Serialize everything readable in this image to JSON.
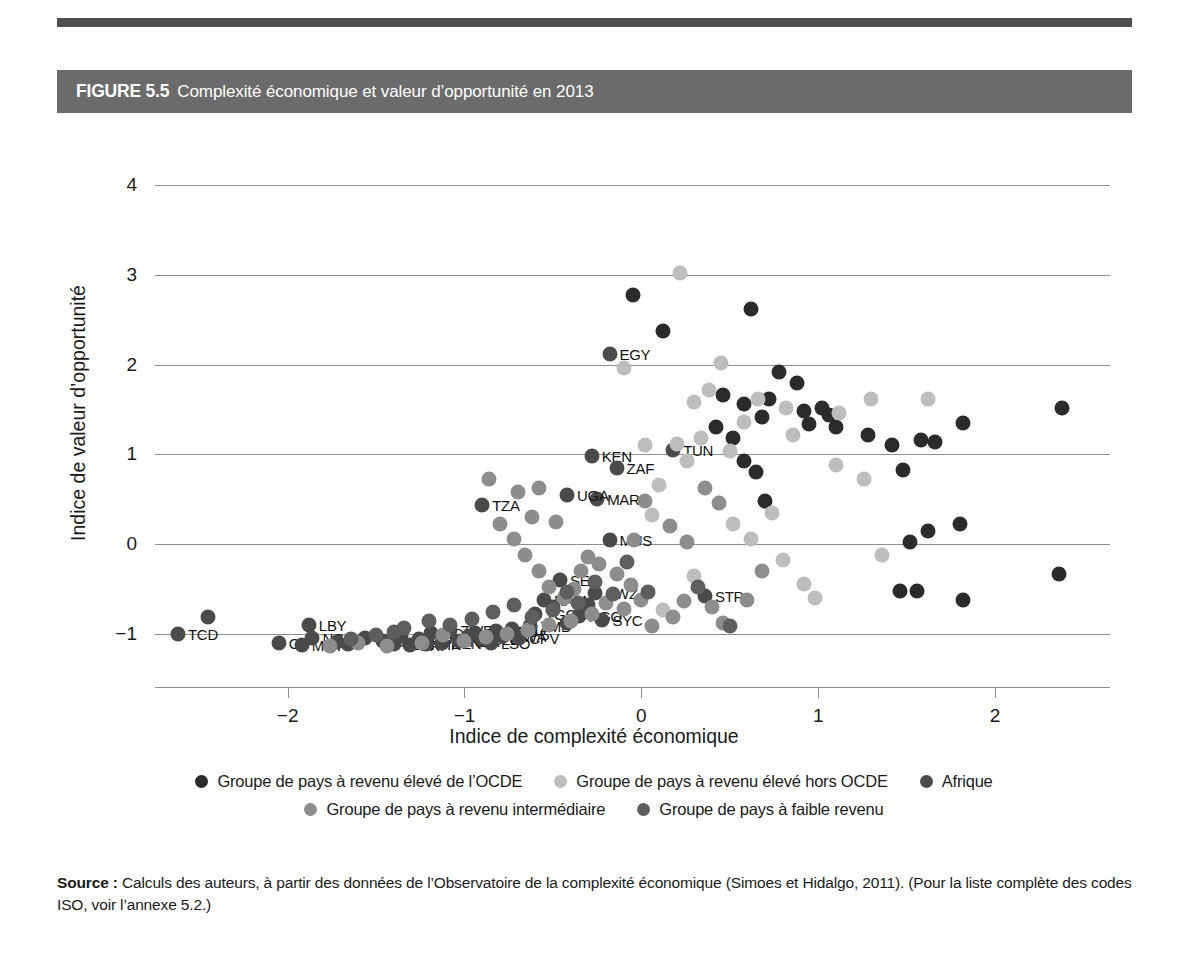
{
  "figure": {
    "number": "FIGURE 5.5",
    "title": "Complexité économique et valeur d’opportunité en 2013"
  },
  "source": {
    "label": "Source :",
    "text": " Calculs des auteurs, à partir des données de l’Observatoire de la complexité économique (Simoes et Hidalgo, 2011). (Pour la liste complète des codes ISO, voir l’annexe 5.2.)"
  },
  "legend": {
    "rows": [
      [
        {
          "label": "Groupe de pays à revenu élevé de l’OCDE",
          "color": "#2b2b2b"
        },
        {
          "label": "Groupe de pays à revenu élevé hors OCDE",
          "color": "#bdbdbd"
        },
        {
          "label": "Afrique",
          "color": "#4a4a4a"
        }
      ],
      [
        {
          "label": "Groupe de pays à revenu intermédiaire",
          "color": "#8d8d8d"
        },
        {
          "label": "Groupe de pays à faible revenu",
          "color": "#5e5e5e"
        }
      ]
    ]
  },
  "chart_data": {
    "type": "scatter",
    "title": "Complexité économique et valeur d’opportunité en 2013",
    "xlabel": "Indice de complexité économique",
    "ylabel": "Indice de valeur d’opportunité",
    "xlim": [
      -2.75,
      2.65
    ],
    "ylim": [
      -1.35,
      4.45
    ],
    "xticks": [
      -2,
      -1,
      0,
      1,
      2
    ],
    "yticks": [
      -1,
      0,
      1,
      2,
      3,
      4
    ],
    "grid": "horizontal",
    "legend_position": "below",
    "colors": {
      "ocde_high": "#2b2b2b",
      "non_ocde_high": "#bdbdbd",
      "afrique": "#4a4a4a",
      "intermediaire": "#8d8d8d",
      "faible": "#5e5e5e"
    },
    "series": [
      {
        "name": "Afrique",
        "color": "#4a4a4a",
        "points": [
          {
            "x": -2.62,
            "y": -1.0,
            "label": "TCD"
          },
          {
            "x": -2.45,
            "y": -0.81,
            "label": ""
          },
          {
            "x": -2.05,
            "y": -1.1,
            "label": "G"
          },
          {
            "x": -1.92,
            "y": -1.13,
            "label": "MRT"
          },
          {
            "x": -1.88,
            "y": -0.9,
            "label": "LBY"
          },
          {
            "x": -1.86,
            "y": -1.05,
            "label": "NGA"
          },
          {
            "x": -1.72,
            "y": -1.09,
            "label": ""
          },
          {
            "x": -1.66,
            "y": -1.12,
            "label": ""
          },
          {
            "x": -1.56,
            "y": -1.05,
            "label": ""
          },
          {
            "x": -1.46,
            "y": -1.08,
            "label": "GMB"
          },
          {
            "x": -1.4,
            "y": -1.12,
            "label": "SDN"
          },
          {
            "x": -1.36,
            "y": -1.03,
            "label": ""
          },
          {
            "x": -1.31,
            "y": -1.13,
            "label": "ERI"
          },
          {
            "x": -1.26,
            "y": -1.06,
            "label": "MOZ"
          },
          {
            "x": -1.22,
            "y": -1.12,
            "label": "GIN"
          },
          {
            "x": -1.19,
            "y": -0.99,
            "label": "MDG"
          },
          {
            "x": -1.13,
            "y": -1.1,
            "label": "BEN"
          },
          {
            "x": -1.08,
            "y": -0.96,
            "label": "ZWE"
          },
          {
            "x": -1.03,
            "y": -1.08,
            "label": "NER"
          },
          {
            "x": -0.98,
            "y": -1.04,
            "label": "CAF"
          },
          {
            "x": -0.94,
            "y": -0.99,
            "label": "BFA"
          },
          {
            "x": -0.9,
            "y": -1.06,
            "label": "SLE"
          },
          {
            "x": -0.85,
            "y": -1.11,
            "label": "LSO"
          },
          {
            "x": -0.82,
            "y": -0.97,
            "label": "GNB"
          },
          {
            "x": -0.78,
            "y": -1.03,
            "label": "BWA"
          },
          {
            "x": -0.73,
            "y": -0.95,
            "label": "MLI"
          },
          {
            "x": -0.69,
            "y": -1.05,
            "label": "CPV"
          },
          {
            "x": -0.63,
            "y": -0.92,
            "label": "ZMB"
          },
          {
            "x": -0.6,
            "y": -0.78,
            "label": "TGO"
          },
          {
            "x": -0.55,
            "y": -0.62,
            "label": "NAM"
          },
          {
            "x": -0.5,
            "y": -0.7,
            "label": ""
          },
          {
            "x": -0.46,
            "y": -0.4,
            "label": "SEN"
          },
          {
            "x": -0.42,
            "y": -0.88,
            "label": ""
          },
          {
            "x": -0.35,
            "y": -0.8,
            "label": "AGO"
          },
          {
            "x": -0.3,
            "y": -0.68,
            "label": ""
          },
          {
            "x": -0.26,
            "y": -0.55,
            "label": "SWZ"
          },
          {
            "x": -0.22,
            "y": -0.85,
            "label": "SYC"
          },
          {
            "x": -0.18,
            "y": 0.04,
            "label": "MUS"
          },
          {
            "x": -0.25,
            "y": 0.5,
            "label": "MAR"
          },
          {
            "x": -0.42,
            "y": 0.55,
            "label": "UGA"
          },
          {
            "x": -0.9,
            "y": 0.43,
            "label": "TZA"
          },
          {
            "x": -0.28,
            "y": 0.98,
            "label": "KEN"
          },
          {
            "x": -0.14,
            "y": 0.85,
            "label": "ZAF"
          },
          {
            "x": 0.18,
            "y": 1.05,
            "label": "TUN"
          },
          {
            "x": -0.18,
            "y": 2.12,
            "label": "EGY"
          },
          {
            "x": 0.36,
            "y": -0.58,
            "label": "STP"
          }
        ]
      },
      {
        "name": "Groupe de pays à revenu élevé de l’OCDE",
        "color": "#2b2b2b",
        "points": [
          {
            "x": 0.62,
            "y": 2.62
          },
          {
            "x": 0.12,
            "y": 2.38
          },
          {
            "x": -0.05,
            "y": 2.78
          },
          {
            "x": 0.78,
            "y": 1.92
          },
          {
            "x": 0.88,
            "y": 1.8
          },
          {
            "x": 0.92,
            "y": 1.48
          },
          {
            "x": 1.02,
            "y": 1.52
          },
          {
            "x": 1.06,
            "y": 1.44
          },
          {
            "x": 1.1,
            "y": 1.3
          },
          {
            "x": 0.95,
            "y": 1.34
          },
          {
            "x": 0.72,
            "y": 1.62
          },
          {
            "x": 0.58,
            "y": 1.56
          },
          {
            "x": 0.68,
            "y": 1.42
          },
          {
            "x": 1.28,
            "y": 1.22
          },
          {
            "x": 1.42,
            "y": 1.1
          },
          {
            "x": 1.58,
            "y": 1.16
          },
          {
            "x": 1.66,
            "y": 1.14
          },
          {
            "x": 1.82,
            "y": 1.35
          },
          {
            "x": 2.38,
            "y": 1.52
          },
          {
            "x": 1.48,
            "y": 0.82
          },
          {
            "x": 1.62,
            "y": 0.14
          },
          {
            "x": 1.52,
            "y": 0.02
          },
          {
            "x": 1.8,
            "y": 0.22
          },
          {
            "x": 1.46,
            "y": -0.52
          },
          {
            "x": 1.56,
            "y": -0.52
          },
          {
            "x": 1.82,
            "y": -0.62
          },
          {
            "x": 2.36,
            "y": -0.33
          },
          {
            "x": 0.58,
            "y": 0.92
          },
          {
            "x": 0.65,
            "y": 0.8
          },
          {
            "x": 0.7,
            "y": 0.48
          },
          {
            "x": 0.52,
            "y": 1.18
          },
          {
            "x": 0.46,
            "y": 1.66
          },
          {
            "x": 0.42,
            "y": 1.3
          }
        ]
      },
      {
        "name": "Groupe de pays à revenu élevé hors OCDE",
        "color": "#bdbdbd",
        "points": [
          {
            "x": 0.22,
            "y": 3.02
          },
          {
            "x": 0.45,
            "y": 2.02
          },
          {
            "x": 0.38,
            "y": 1.72
          },
          {
            "x": 0.3,
            "y": 1.58
          },
          {
            "x": 0.34,
            "y": 1.18
          },
          {
            "x": 0.58,
            "y": 1.36
          },
          {
            "x": 0.66,
            "y": 1.62
          },
          {
            "x": 0.82,
            "y": 1.52
          },
          {
            "x": 0.86,
            "y": 1.22
          },
          {
            "x": 1.12,
            "y": 1.46
          },
          {
            "x": 1.3,
            "y": 1.62
          },
          {
            "x": 1.62,
            "y": 1.62
          },
          {
            "x": 1.1,
            "y": 0.88
          },
          {
            "x": 1.26,
            "y": 0.72
          },
          {
            "x": 1.36,
            "y": -0.12
          },
          {
            "x": 0.5,
            "y": 1.04
          },
          {
            "x": 0.26,
            "y": 0.92
          },
          {
            "x": 0.2,
            "y": 1.12
          },
          {
            "x": 0.02,
            "y": 1.1
          },
          {
            "x": -0.1,
            "y": 1.96
          },
          {
            "x": 0.1,
            "y": 0.66
          },
          {
            "x": 0.06,
            "y": 0.32
          },
          {
            "x": 0.52,
            "y": 0.22
          },
          {
            "x": 0.62,
            "y": 0.06
          },
          {
            "x": 0.74,
            "y": 0.34
          },
          {
            "x": 0.8,
            "y": -0.18
          },
          {
            "x": 0.92,
            "y": -0.45
          },
          {
            "x": 0.98,
            "y": -0.6
          },
          {
            "x": 0.3,
            "y": -0.36
          },
          {
            "x": 0.12,
            "y": -0.74
          }
        ]
      },
      {
        "name": "Groupe de pays à revenu intermédiaire",
        "color": "#8d8d8d",
        "points": [
          {
            "x": -0.58,
            "y": 0.62
          },
          {
            "x": -0.7,
            "y": 0.58
          },
          {
            "x": -0.62,
            "y": 0.3
          },
          {
            "x": -0.48,
            "y": 0.24
          },
          {
            "x": -0.8,
            "y": 0.22
          },
          {
            "x": -0.72,
            "y": 0.06
          },
          {
            "x": -0.86,
            "y": 0.72
          },
          {
            "x": -0.66,
            "y": -0.12
          },
          {
            "x": -0.58,
            "y": -0.3
          },
          {
            "x": -0.52,
            "y": -0.48
          },
          {
            "x": -0.44,
            "y": -0.6
          },
          {
            "x": -0.38,
            "y": -0.5
          },
          {
            "x": -0.34,
            "y": -0.3
          },
          {
            "x": -0.3,
            "y": -0.14
          },
          {
            "x": -0.24,
            "y": -0.22
          },
          {
            "x": -0.14,
            "y": -0.34
          },
          {
            "x": -0.06,
            "y": -0.46
          },
          {
            "x": 0.0,
            "y": -0.62
          },
          {
            "x": -0.1,
            "y": -0.72
          },
          {
            "x": -0.2,
            "y": -0.66
          },
          {
            "x": -0.28,
            "y": -0.78
          },
          {
            "x": -0.4,
            "y": -0.86
          },
          {
            "x": -0.52,
            "y": -0.9
          },
          {
            "x": -0.64,
            "y": -0.96
          },
          {
            "x": -0.76,
            "y": -1.0
          },
          {
            "x": -0.88,
            "y": -1.04
          },
          {
            "x": -1.0,
            "y": -1.08
          },
          {
            "x": -1.12,
            "y": -1.02
          },
          {
            "x": -1.24,
            "y": -1.1
          },
          {
            "x": -1.44,
            "y": -1.14
          },
          {
            "x": -1.6,
            "y": -1.1
          },
          {
            "x": -1.76,
            "y": -1.14
          },
          {
            "x": 0.06,
            "y": -0.92
          },
          {
            "x": 0.18,
            "y": -0.82
          },
          {
            "x": 0.24,
            "y": -0.64
          },
          {
            "x": 0.4,
            "y": -0.7
          },
          {
            "x": 0.46,
            "y": -0.88
          },
          {
            "x": 0.6,
            "y": -0.62
          },
          {
            "x": 0.26,
            "y": 0.02
          },
          {
            "x": 0.16,
            "y": 0.2
          },
          {
            "x": 0.02,
            "y": 0.48
          },
          {
            "x": -0.04,
            "y": 0.04
          },
          {
            "x": 0.36,
            "y": 0.62
          },
          {
            "x": 0.44,
            "y": 0.46
          },
          {
            "x": 0.68,
            "y": -0.3
          }
        ]
      },
      {
        "name": "Groupe de pays à faible revenu",
        "color": "#5e5e5e",
        "points": [
          {
            "x": -1.2,
            "y": -0.86
          },
          {
            "x": -1.34,
            "y": -0.94
          },
          {
            "x": -1.5,
            "y": -1.02
          },
          {
            "x": -1.64,
            "y": -1.06
          },
          {
            "x": -0.96,
            "y": -0.84
          },
          {
            "x": -0.84,
            "y": -0.76
          },
          {
            "x": -0.72,
            "y": -0.68
          },
          {
            "x": -0.62,
            "y": -0.82
          },
          {
            "x": -0.5,
            "y": -0.74
          },
          {
            "x": -0.42,
            "y": -0.54
          },
          {
            "x": -0.36,
            "y": -0.66
          },
          {
            "x": -0.26,
            "y": -0.42
          },
          {
            "x": -0.16,
            "y": -0.56
          },
          {
            "x": -0.08,
            "y": -0.2
          },
          {
            "x": -1.08,
            "y": -0.9
          },
          {
            "x": -1.4,
            "y": -0.98
          },
          {
            "x": 0.04,
            "y": -0.54
          },
          {
            "x": 0.32,
            "y": -0.48
          },
          {
            "x": 0.5,
            "y": -0.92
          }
        ]
      }
    ]
  }
}
